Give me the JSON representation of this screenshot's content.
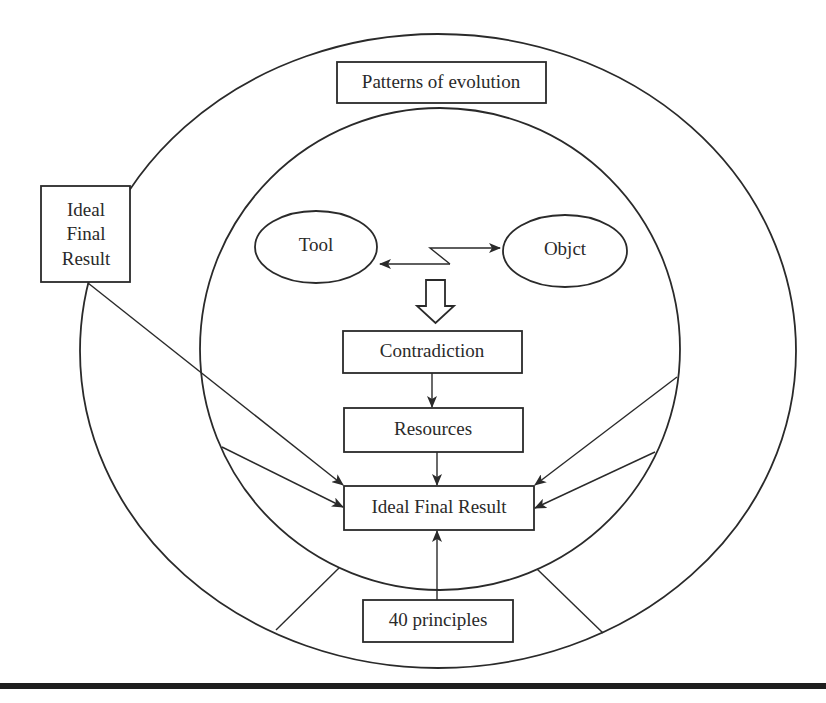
{
  "diagram": {
    "type": "concept-diagram",
    "outer_ring_label": "Patterns of evolution",
    "side_box_label_lines": [
      "Ideal",
      "Final",
      "Result"
    ],
    "nodes": {
      "tool": "Tool",
      "object": "Objct",
      "contradiction": "Contradiction",
      "resources": "Resources",
      "ideal_final_result": "Ideal Final Result",
      "principles": "40 principles"
    },
    "edges": [
      {
        "from": "Tool",
        "to": "Objct",
        "style": "zigzag double-headed arrow (conflict)"
      },
      {
        "from": "Tool/Objct conflict",
        "to": "Contradiction",
        "style": "hollow block arrow"
      },
      {
        "from": "Contradiction",
        "to": "Resources",
        "style": "arrow"
      },
      {
        "from": "Resources",
        "to": "Ideal Final Result",
        "style": "arrow"
      },
      {
        "from": "40 principles",
        "to": "Ideal Final Result",
        "style": "arrow"
      },
      {
        "from": "Ideal Final Result (side box)",
        "to": "Ideal Final Result",
        "style": "arrow"
      },
      {
        "from": "outer ring left segment",
        "to": "Ideal Final Result",
        "style": "arrow"
      },
      {
        "from": "inner circle right",
        "to": "Ideal Final Result",
        "style": "arrow"
      },
      {
        "from": "outer ring right segment",
        "to": "Ideal Final Result",
        "style": "arrow"
      }
    ],
    "colors": {
      "stroke": "#2a2a2a",
      "background": "#ffffff"
    }
  }
}
